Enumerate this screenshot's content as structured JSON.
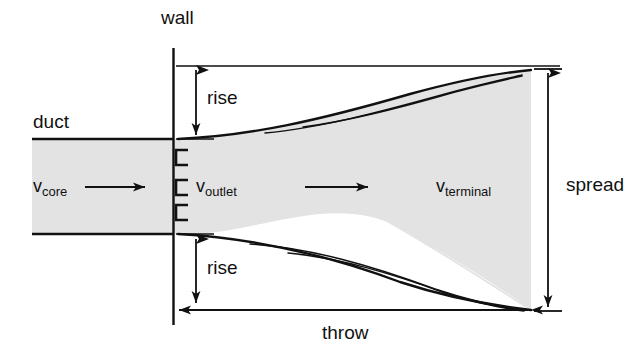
{
  "figure": {
    "type": "technical-diagram",
    "background_color": "#ffffff",
    "line_color": "#111111",
    "jet_fill_color": "#e3e3e3"
  },
  "labels": {
    "wall": "wall",
    "duct": "duct",
    "rise_top": "rise",
    "rise_bottom": "rise",
    "throw": "throw",
    "spread": "spread"
  },
  "velocities": [
    {
      "name": "v-core",
      "symbol": "v",
      "subscript": "core"
    },
    {
      "name": "v-outlet",
      "symbol": "v",
      "subscript": "outlet"
    },
    {
      "name": "v-terminal",
      "symbol": "v",
      "subscript": "terminal"
    }
  ],
  "annotations": {
    "flow_arrows": 2,
    "outlet_louver_marks": 3
  }
}
